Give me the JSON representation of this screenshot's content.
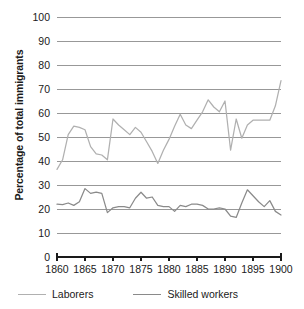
{
  "chart_data": {
    "type": "line",
    "title": "",
    "subtitle": "",
    "xlabel": "",
    "ylabel": "Percentage of total immigrants",
    "xlim": [
      1860,
      1900
    ],
    "ylim": [
      0,
      100
    ],
    "grid": true,
    "grid_axis": "y",
    "legend_position": "bottom",
    "x_tick_labels": [
      "1860",
      "1865",
      "1870",
      "1875",
      "1880",
      "1885",
      "1890",
      "1895",
      "1900"
    ],
    "x_tick_values": [
      1860,
      1865,
      1870,
      1875,
      1880,
      1885,
      1890,
      1895,
      1900
    ],
    "y_tick_labels": [
      "0",
      "10",
      "20",
      "30",
      "40",
      "50",
      "60",
      "70",
      "80",
      "90",
      "100"
    ],
    "y_tick_values": [
      0,
      10,
      20,
      30,
      40,
      50,
      60,
      70,
      80,
      90,
      100
    ],
    "x": [
      1860,
      1861,
      1862,
      1863,
      1864,
      1865,
      1866,
      1867,
      1868,
      1869,
      1870,
      1871,
      1872,
      1873,
      1874,
      1875,
      1876,
      1877,
      1878,
      1879,
      1880,
      1881,
      1882,
      1883,
      1884,
      1885,
      1886,
      1887,
      1888,
      1889,
      1890,
      1891,
      1892,
      1893,
      1894,
      1895,
      1896,
      1897,
      1898,
      1899,
      1900
    ],
    "series": [
      {
        "name": "Laborers",
        "color": "#b0b0b0",
        "values": [
          36.5,
          40.5,
          51.0,
          54.5,
          54.0,
          53.0,
          46.0,
          43.0,
          42.5,
          40.5,
          57.5,
          55.0,
          53.0,
          51.0,
          54.0,
          52.0,
          48.0,
          44.0,
          39.0,
          44.5,
          49.0,
          54.5,
          59.5,
          55.0,
          53.5,
          57.0,
          60.5,
          65.5,
          62.5,
          60.5,
          65.0,
          44.5,
          57.5,
          49.5,
          55.0,
          57.0,
          57.0,
          57.0,
          57.0,
          63.0,
          73.5
        ]
      },
      {
        "name": "Skilled workers",
        "color": "#8a8a8a",
        "values": [
          22.0,
          21.8,
          22.5,
          21.5,
          23.0,
          28.5,
          26.5,
          27.0,
          26.5,
          18.5,
          20.5,
          21.0,
          21.0,
          20.5,
          24.5,
          27.0,
          24.5,
          25.0,
          21.5,
          21.0,
          21.0,
          19.0,
          21.5,
          21.0,
          22.0,
          22.0,
          21.5,
          20.0,
          20.0,
          20.5,
          20.0,
          17.0,
          16.5,
          22.5,
          28.0,
          25.5,
          23.0,
          21.0,
          23.5,
          19.0,
          17.5
        ]
      }
    ]
  },
  "legend": {
    "items": [
      {
        "label": "Laborers",
        "color": "#b0b0b0"
      },
      {
        "label": "Skilled workers",
        "color": "#8a8a8a"
      }
    ]
  },
  "axis": {
    "y_title": "Percentage of total immigrants"
  }
}
